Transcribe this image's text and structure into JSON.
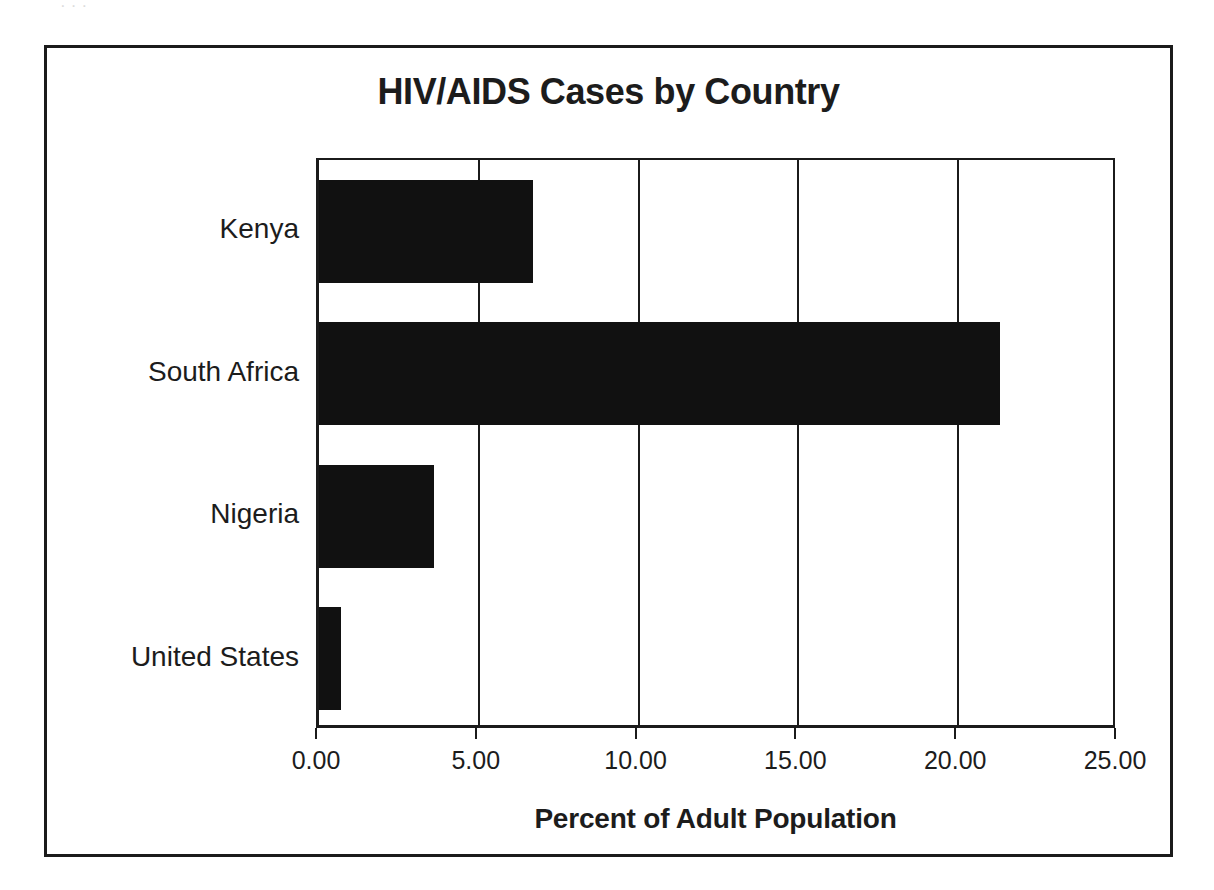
{
  "scan_artifact": {
    "text": "· · ·"
  },
  "chart_data": {
    "type": "bar",
    "orientation": "horizontal",
    "title": "HIV/AIDS Cases by Country",
    "xlabel": "Percent of Adult Population",
    "ylabel": "",
    "categories": [
      "Kenya",
      "South Africa",
      "Nigeria",
      "United States"
    ],
    "values": [
      6.7,
      21.3,
      3.6,
      0.7
    ],
    "series": [
      {
        "name": "Percent of Adult Population",
        "values": [
          6.7,
          21.3,
          3.6,
          0.7
        ]
      }
    ],
    "xlim": [
      0,
      25
    ],
    "xticks": [
      0,
      5,
      10,
      15,
      20,
      25
    ],
    "xtick_labels": [
      "0.00",
      "5.00",
      "10.00",
      "15.00",
      "20.00",
      "25.00"
    ],
    "grid": true,
    "grid_axis": "x",
    "legend": false,
    "legend_position": "none",
    "bar_color": "#111111",
    "axis_color": "#1b1b1b",
    "text_color": "#1c1c1c",
    "background_color": "#ffffff"
  }
}
